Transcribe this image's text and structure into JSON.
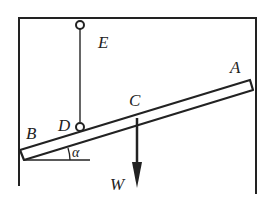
{
  "diagram": {
    "labels": {
      "A": "A",
      "B": "B",
      "C": "C",
      "D": "D",
      "E": "E",
      "W": "W",
      "alpha": "α"
    },
    "colors": {
      "stroke": "#222222",
      "background": "#ffffff"
    }
  }
}
